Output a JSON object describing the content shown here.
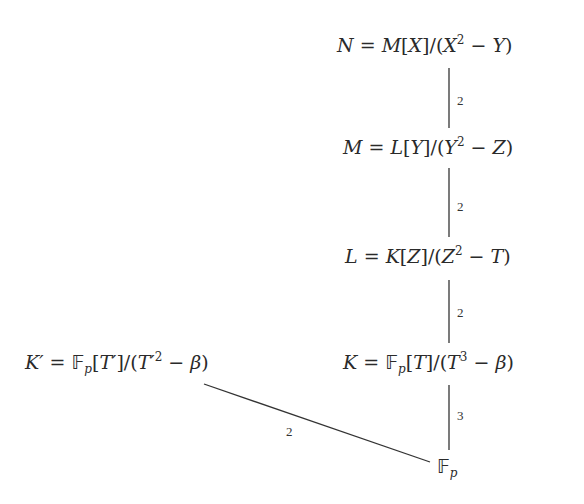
{
  "diagram": {
    "type": "field-extension-tower",
    "nodes": [
      {
        "id": "N",
        "label": "N = M[X]/(X² − Y)",
        "lhs": "N",
        "ring": "M",
        "var": "X",
        "exp": "2",
        "minus": "Y"
      },
      {
        "id": "M",
        "label": "M = L[Y]/(Y² − Z)",
        "lhs": "M",
        "ring": "L",
        "var": "Y",
        "exp": "2",
        "minus": "Z"
      },
      {
        "id": "L",
        "label": "L = K[Z]/(Z² − T)",
        "lhs": "L",
        "ring": "K",
        "var": "Z",
        "exp": "2",
        "minus": "T"
      },
      {
        "id": "K",
        "label": "K = 𝔽p[T]/(T³ − β)",
        "lhs": "K",
        "ring": "𝔽",
        "ring_sub": "p",
        "var": "T",
        "exp": "3",
        "minus": "β"
      },
      {
        "id": "Kprime",
        "label": "K′ = 𝔽p[T′]/(T′² − β)",
        "lhs": "K′",
        "ring": "𝔽",
        "ring_sub": "p",
        "var": "T′",
        "exp": "2",
        "minus": "β"
      },
      {
        "id": "Fp",
        "label": "𝔽p",
        "base": "𝔽",
        "sub": "p"
      }
    ],
    "edges": [
      {
        "from": "M",
        "to": "N",
        "degree": "2"
      },
      {
        "from": "L",
        "to": "M",
        "degree": "2"
      },
      {
        "from": "K",
        "to": "L",
        "degree": "2"
      },
      {
        "from": "Fp",
        "to": "K",
        "degree": "3"
      },
      {
        "from": "Fp",
        "to": "Kprime",
        "degree": "2"
      }
    ]
  },
  "symbols": {
    "eq": "=",
    "slash": "/",
    "lb": "[",
    "rb": "]",
    "lp": "(",
    "rp": ")",
    "minus": " − "
  }
}
